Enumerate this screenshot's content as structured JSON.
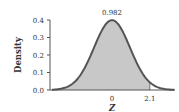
{
  "chart_data": {
    "type": "area",
    "title": "",
    "xlabel": "Z",
    "ylabel": "Density",
    "distribution": "standard normal",
    "ylim": [
      0.0,
      0.4
    ],
    "xlim": [
      -3.5,
      3.5
    ],
    "y_ticks": [
      {
        "value": 0.0,
        "label": "0.0"
      },
      {
        "value": 0.1,
        "label": "0.1"
      },
      {
        "value": 0.2,
        "label": "0.2"
      },
      {
        "value": 0.3,
        "label": "0.3"
      },
      {
        "value": 0.4,
        "label": "0.4"
      }
    ],
    "x_ticks": [
      {
        "value": 0,
        "label": "0"
      },
      {
        "value": 2.1,
        "label": "2.1"
      }
    ],
    "shaded_region": {
      "from": -3.5,
      "to": 2.1,
      "area": 0.982
    },
    "annotation": {
      "text": "0.982",
      "x": 0,
      "y": 0.42
    },
    "grid": false,
    "legend": null,
    "colors": {
      "curve": "#555555",
      "fill": "#c8c8c8",
      "axis": "#555555",
      "text": "#333333"
    }
  }
}
